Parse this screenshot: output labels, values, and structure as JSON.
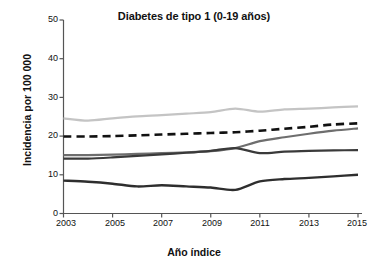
{
  "chart_data": {
    "type": "line",
    "title": "Diabetes de tipo 1 (0-19 años)",
    "xlabel": "Año índice",
    "ylabel": "Incidencia por 100 000",
    "x": [
      2003,
      2004,
      2005,
      2006,
      2007,
      2008,
      2009,
      2010,
      2011,
      2012,
      2013,
      2014,
      2015
    ],
    "xtick_labels": [
      "2003",
      "2005",
      "2007",
      "2009",
      "2011",
      "2013",
      "2015"
    ],
    "xticks": [
      2003,
      2005,
      2007,
      2009,
      2011,
      2013,
      2015
    ],
    "ytick_labels": [
      "0",
      "10",
      "20",
      "30",
      "40",
      "50"
    ],
    "yticks": [
      0,
      10,
      20,
      30,
      40,
      50
    ],
    "ylim": [
      0,
      50
    ],
    "xlim": [
      2003,
      2015
    ],
    "grid": false,
    "legend": "none",
    "series": [
      {
        "name": "series-light-gray",
        "color": "#c4c4c4",
        "style": "solid",
        "width": 2.2,
        "values": [
          24.6,
          24.0,
          24.6,
          25.1,
          25.4,
          25.8,
          26.2,
          27.1,
          26.3,
          26.9,
          27.1,
          27.4,
          27.7
        ]
      },
      {
        "name": "series-dashed-black",
        "color": "#111111",
        "style": "dashed",
        "width": 2.6,
        "values": [
          19.9,
          19.9,
          20.0,
          20.2,
          20.4,
          20.6,
          20.8,
          21.0,
          21.4,
          21.9,
          22.4,
          23.0,
          23.3
        ]
      },
      {
        "name": "series-medium-gray",
        "color": "#6e6e6e",
        "style": "solid",
        "width": 2.2,
        "values": [
          15.1,
          15.1,
          15.2,
          15.4,
          15.6,
          15.8,
          16.1,
          16.9,
          18.7,
          19.7,
          20.6,
          21.4,
          22.0
        ]
      },
      {
        "name": "series-dark-gray",
        "color": "#3a3a3a",
        "style": "solid",
        "width": 2.2,
        "values": [
          14.2,
          14.2,
          14.5,
          14.9,
          15.3,
          15.7,
          16.2,
          16.9,
          15.6,
          16.0,
          16.2,
          16.3,
          16.4
        ]
      },
      {
        "name": "series-bottom-dark",
        "color": "#2e2e2e",
        "style": "solid",
        "width": 2.4,
        "values": [
          8.5,
          8.2,
          7.7,
          7.0,
          7.3,
          7.0,
          6.7,
          6.1,
          8.3,
          8.9,
          9.2,
          9.6,
          10.0
        ]
      }
    ]
  },
  "axes": {
    "y_tick_0": "0",
    "y_tick_10": "10",
    "y_tick_20": "20",
    "y_tick_30": "30",
    "y_tick_40": "40",
    "y_tick_50": "50",
    "x_tick_2003": "2003",
    "x_tick_2005": "2005",
    "x_tick_2007": "2007",
    "x_tick_2009": "2009",
    "x_tick_2011": "2011",
    "x_tick_2013": "2013",
    "x_tick_2015": "2015"
  }
}
